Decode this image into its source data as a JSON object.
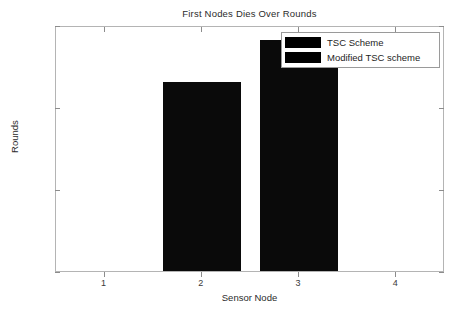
{
  "chart_data": {
    "type": "bar",
    "title": "First Nodes Dies Over Rounds",
    "xlabel": "Sensor Node",
    "ylabel": "Rounds",
    "categories": [
      "1",
      "2",
      "3",
      "4"
    ],
    "x": [
      1,
      2,
      3,
      4
    ],
    "series": [
      {
        "name": "TSC Scheme",
        "color": "#000000",
        "values": [
          0,
          115,
          0,
          0
        ]
      },
      {
        "name": "Modified TSC scheme",
        "color": "#000000",
        "values": [
          0,
          0,
          141,
          0
        ]
      }
    ],
    "bars": [
      {
        "label": "2",
        "series": "TSC Scheme",
        "value": 115,
        "x_center": 2
      },
      {
        "label": "3",
        "series": "Modified TSC scheme",
        "value": 141,
        "x_center": 3
      }
    ],
    "xlim": [
      0.5,
      4.5
    ],
    "ylim": [
      0,
      150
    ],
    "yticks": [
      0,
      50,
      100,
      150
    ],
    "ytick_labels": [
      "0",
      "50",
      "100",
      "150"
    ],
    "xticks": [
      1,
      2,
      3,
      4
    ],
    "xtick_labels": [
      "1",
      "2",
      "3",
      "4"
    ],
    "grid": false,
    "legend_position": "top-right",
    "legend": [
      "TSC Scheme",
      "Modified TSC scheme"
    ],
    "background": "#ffffff",
    "axis_color": "#b4b4b4"
  }
}
